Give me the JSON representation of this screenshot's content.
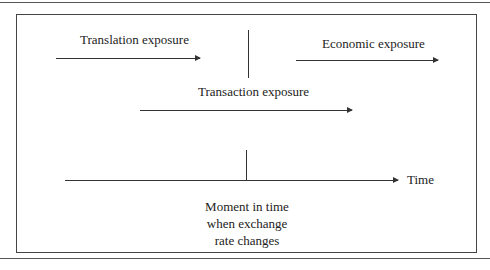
{
  "diagram": {
    "labels": {
      "translation": "Translation exposure",
      "economic": "Economic exposure",
      "transaction": "Transaction exposure",
      "time": "Time",
      "moment_line1": "Moment in time",
      "moment_line2": "when exchange",
      "moment_line3": "rate changes"
    },
    "colors": {
      "line": "#333333",
      "text": "#222222",
      "background": "#ffffff"
    }
  }
}
